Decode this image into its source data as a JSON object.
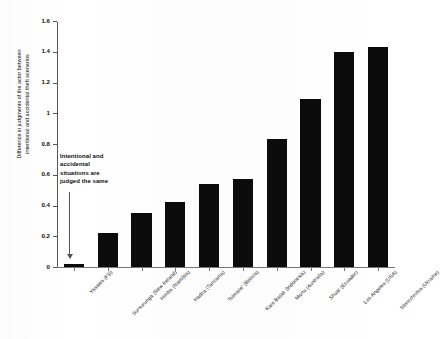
{
  "chart_data": {
    "type": "bar",
    "title": "",
    "subtitle": "",
    "xlabel": "",
    "ylabel": "Difference in judgments of the actor between intentional and accidental theft scenarios",
    "ylim": [
      0,
      1.6
    ],
    "yticks": [
      "0",
      "0.2",
      "0.4",
      "0.6",
      "0.8",
      "1",
      "1.2",
      "1.4",
      "1.6"
    ],
    "ytick_values": [
      0,
      0.2,
      0.4,
      0.6,
      0.8,
      1.0,
      1.2,
      1.4,
      1.6
    ],
    "grid": false,
    "legend": "none",
    "bar_color": "#0b0b0b",
    "categories": [
      "Yasawa (Fiji)",
      "Sursurunga (New Ireland)",
      "Himba (Namibia)",
      "Hadza (Tanzania)",
      "Tsimane' (Bolivia)",
      "Karo Batak (Indonesia)",
      "Martu (Australia)",
      "Shuar (Ecuador)",
      "Los Angeles (USA)",
      "Storozhnitsa (Ukraine)"
    ],
    "values": [
      0.02,
      0.22,
      0.35,
      0.42,
      0.54,
      0.57,
      0.83,
      1.09,
      1.4,
      1.43
    ],
    "annotations": [
      {
        "text": "Intentional and accidental situations are judged the same",
        "points_to_category": "Yasawa (Fiji)",
        "points_to_value": 0
      }
    ]
  },
  "axis": {
    "y_title": "Difference in judgments of the actor between\nintentional and accidental theft scenarios"
  },
  "annotation": {
    "line1": "Intentional and",
    "line2": "accidental",
    "line3": "situations are",
    "line4": "judged the same",
    "full": "Intentional and accidental situations are judged the same"
  }
}
